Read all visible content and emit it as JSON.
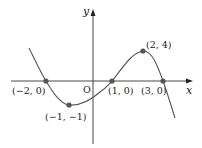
{
  "diagram": {
    "type": "function-graph",
    "axes": {
      "x_label": "x",
      "y_label": "y",
      "origin_label": "O"
    },
    "points": [
      {
        "label": "(−2, 0)",
        "x": -2,
        "y": 0
      },
      {
        "label": "(−1, −1)",
        "x": -1,
        "y": -1
      },
      {
        "label": "(1, 0)",
        "x": 1,
        "y": 0
      },
      {
        "label": "(2, 4)",
        "x": 2,
        "y": 4
      },
      {
        "label": "(3, 0)",
        "x": 3,
        "y": 0
      }
    ],
    "colors": {
      "axis": "#333333",
      "curve": "#555555",
      "point": "#555555"
    }
  }
}
